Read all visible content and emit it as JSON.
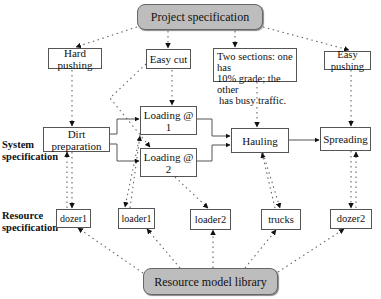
{
  "diagram": {
    "top": {
      "label": "Project specification"
    },
    "bottom": {
      "label": "Resource model library"
    },
    "row_labels": {
      "system": [
        "System",
        "specification"
      ],
      "resource": [
        "Resource",
        "specification"
      ]
    },
    "project_attributes": [
      {
        "id": "hard-pushing",
        "label": "Hard pushing"
      },
      {
        "id": "easy-cut",
        "label": "Easy cut"
      },
      {
        "id": "two-sections",
        "lines": [
          "Two sections: one has",
          "10% grade; the other",
          "has busy traffic."
        ]
      },
      {
        "id": "easy-pushing",
        "label": "Easy pushing"
      }
    ],
    "system_nodes": [
      {
        "id": "dirt-preparation",
        "label": "Dirt preparation"
      },
      {
        "id": "loading-1",
        "label": "Loading @ 1"
      },
      {
        "id": "loading-2",
        "label": "Loading @ 2"
      },
      {
        "id": "hauling",
        "label": "Hauling"
      },
      {
        "id": "spreading",
        "label": "Spreading"
      }
    ],
    "resources": [
      {
        "id": "dozer1",
        "label": "dozer1"
      },
      {
        "id": "loader1",
        "label": "loader1"
      },
      {
        "id": "loader2",
        "label": "loader2"
      },
      {
        "id": "trucks",
        "label": "trucks"
      },
      {
        "id": "dozer2",
        "label": "dozer2"
      }
    ],
    "edges_solid": [
      [
        "dirt-preparation",
        "loading-1"
      ],
      [
        "dirt-preparation",
        "loading-2"
      ],
      [
        "loading-1",
        "hauling"
      ],
      [
        "loading-2",
        "hauling"
      ],
      [
        "hauling",
        "spreading"
      ]
    ],
    "edges_dotted": [
      [
        "project-specification",
        "hard-pushing"
      ],
      [
        "project-specification",
        "easy-cut"
      ],
      [
        "project-specification",
        "two-sections"
      ],
      [
        "project-specification",
        "easy-pushing"
      ],
      [
        "hard-pushing",
        "dirt-preparation"
      ],
      [
        "easy-cut",
        "loading-1"
      ],
      [
        "easy-cut",
        "loading-2"
      ],
      [
        "two-sections",
        "hauling"
      ],
      [
        "easy-pushing",
        "spreading"
      ],
      [
        "dirt-preparation",
        "dozer1"
      ],
      [
        "loading-1",
        "loader1"
      ],
      [
        "loading-2",
        "loader2"
      ],
      [
        "hauling",
        "trucks"
      ],
      [
        "spreading",
        "dozer2"
      ],
      [
        "resource-model-library",
        "dozer1"
      ],
      [
        "resource-model-library",
        "loader1"
      ],
      [
        "resource-model-library",
        "loader2"
      ],
      [
        "resource-model-library",
        "trucks"
      ],
      [
        "resource-model-library",
        "dozer2"
      ]
    ]
  }
}
